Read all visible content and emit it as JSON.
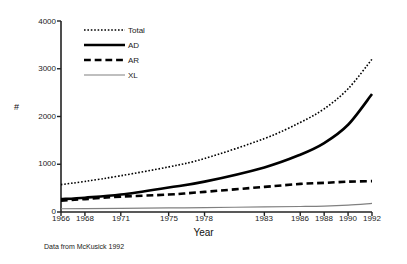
{
  "chart_data": {
    "type": "line",
    "title": "",
    "xlabel": "Year",
    "ylabel": "#",
    "source_note": "Data from McKusick 1992",
    "grid": false,
    "legend_position": "upper-left",
    "xlim": [
      1966,
      1992
    ],
    "ylim": [
      0,
      4000
    ],
    "xticks": [
      "1966",
      "1968",
      "1971",
      "1975",
      "1978",
      "1983",
      "1986",
      "1988",
      "1990",
      "1992"
    ],
    "xtick_values": [
      1966,
      1968,
      1971,
      1975,
      1978,
      1983,
      1986,
      1988,
      1990,
      1992
    ],
    "yticks": [
      "0",
      "1000",
      "2000",
      "3000",
      "4000"
    ],
    "ytick_values": [
      0,
      1000,
      2000,
      3000,
      4000
    ],
    "x": [
      1966,
      1968,
      1971,
      1975,
      1978,
      1983,
      1986,
      1988,
      1990,
      1992
    ],
    "series": [
      {
        "name": "Total",
        "style": "dotted",
        "color": "#000000",
        "width": 1.6,
        "values": [
          574,
          640,
          760,
          944,
          1120,
          1537,
          1876,
          2160,
          2580,
          3200
        ]
      },
      {
        "name": "AD",
        "style": "solid",
        "color": "#000000",
        "width": 2.6,
        "values": [
          269,
          300,
          365,
          513,
          636,
          934,
          1200,
          1443,
          1827,
          2470
        ]
      },
      {
        "name": "AR",
        "style": "dashed",
        "color": "#000000",
        "width": 2.6,
        "values": [
          237,
          270,
          322,
          365,
          422,
          526,
          588,
          610,
          635,
          647
        ]
      },
      {
        "name": "XL",
        "style": "solid",
        "color": "#808080",
        "width": 1.2,
        "values": [
          68,
          71,
          75,
          85,
          93,
          107,
          115,
          124,
          145,
          180
        ]
      }
    ]
  },
  "legend": {
    "items": [
      {
        "label": "Total"
      },
      {
        "label": "AD"
      },
      {
        "label": "AR"
      },
      {
        "label": "XL"
      }
    ]
  }
}
